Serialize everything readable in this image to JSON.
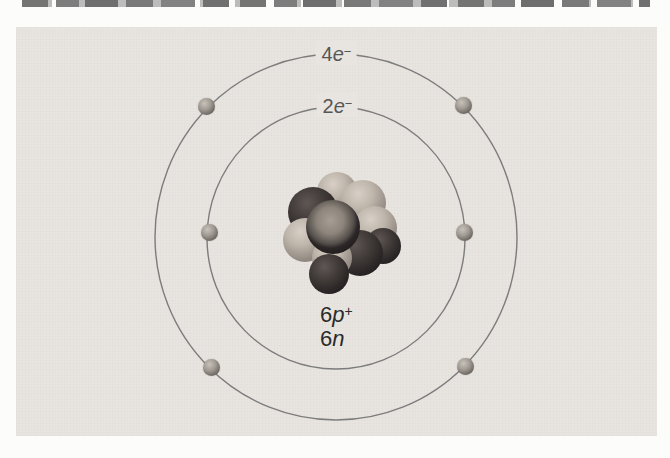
{
  "diagram": {
    "shell_labels": {
      "outer": {
        "count": "4",
        "particle": "e",
        "charge": "−"
      },
      "inner": {
        "count": "2",
        "particle": "e",
        "charge": "−"
      }
    },
    "nucleus_labels": {
      "protons": {
        "count": "6",
        "particle": "p",
        "charge": "+"
      },
      "neutrons": {
        "count": "6",
        "particle": "n",
        "charge": ""
      }
    },
    "electrons": {
      "outer_count": 4,
      "inner_count": 2
    },
    "colors": {
      "panel_background": "#e8e5e1",
      "orbit_line": "#7c7c7c",
      "shell_label_text": "#565656",
      "nucleus_label_text": "#2a2a2a"
    }
  }
}
